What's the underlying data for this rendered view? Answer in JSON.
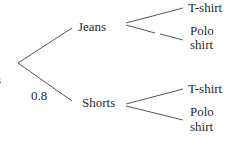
{
  "diagram": {
    "type": "tree_diagram",
    "root_label_fragment": "s",
    "branches": [
      {
        "label": "Jeans",
        "probability": "",
        "children": [
          {
            "label": "T-shirt"
          },
          {
            "label_line1": "Polo",
            "label_line2": "shirt"
          }
        ]
      },
      {
        "label": "Shorts",
        "probability": "0.8",
        "children": [
          {
            "label": "T-shirt"
          },
          {
            "label_line1": "Polo",
            "label_line2": "shirt"
          }
        ]
      }
    ]
  }
}
